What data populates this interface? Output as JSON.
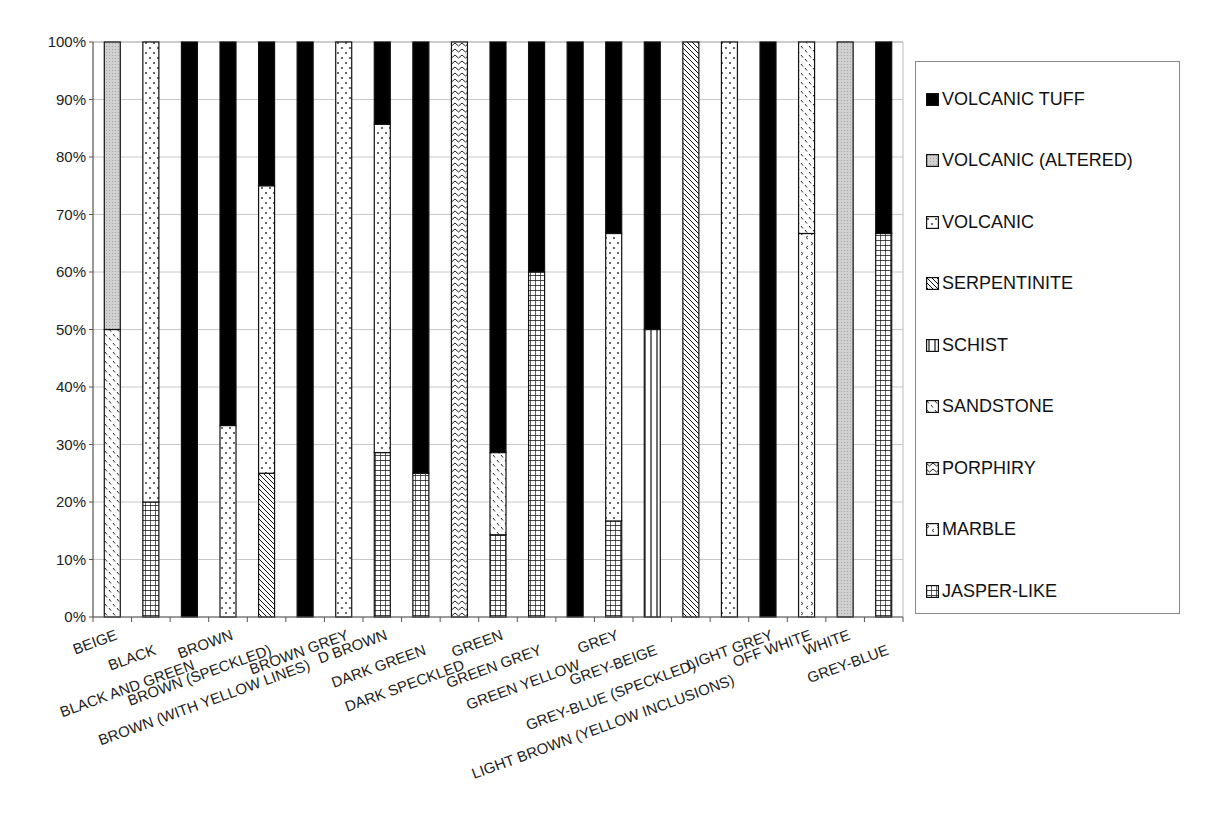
{
  "chart_data": {
    "type": "bar",
    "stacked": "percent",
    "title": "",
    "xlabel": "",
    "ylabel": "",
    "ylim": [
      0,
      100
    ],
    "yticks": [
      "0%",
      "10%",
      "20%",
      "30%",
      "40%",
      "50%",
      "60%",
      "70%",
      "80%",
      "90%",
      "100%"
    ],
    "grid": true,
    "legend_position": "right",
    "categories": [
      "BEIGE",
      "BLACK",
      "BLACK AND GREEN",
      "BROWN",
      "BROWN (SPECKLED)",
      "BROWN (WITH YELLOW LINES)",
      "BROWN GREY",
      "D BROWN",
      "DARK GREEN",
      "DARK SPECKLED",
      "GREEN",
      "GREEN GREY",
      "GREEN YELLOW",
      "GREY",
      "GREY-BEIGE",
      "GREY-BLUE (SPECKLED)",
      "LIGHT BROWN (YELLOW INCLUSIONS)",
      "LIGHT GREY",
      "OFF WHITE",
      "WHITE",
      "GREY-BLUE"
    ],
    "series": [
      {
        "name": "JASPER-LIKE",
        "pattern": "grid",
        "values": [
          0,
          20,
          0,
          0,
          0,
          0,
          0,
          28.6,
          25,
          0,
          14.3,
          60,
          0,
          16.7,
          0,
          0,
          0,
          0,
          0,
          0,
          66.7
        ]
      },
      {
        "name": "MARBLE",
        "pattern": "chevron-dots",
        "values": [
          0,
          0,
          0,
          0,
          0,
          0,
          0,
          0,
          0,
          0,
          0,
          0,
          0,
          0,
          0,
          0,
          0,
          0,
          66.7,
          0,
          0
        ]
      },
      {
        "name": "PORPHIRY",
        "pattern": "wave",
        "values": [
          0,
          0,
          0,
          0,
          0,
          0,
          0,
          0,
          0,
          100,
          0,
          0,
          0,
          0,
          0,
          0,
          0,
          0,
          0,
          0,
          0
        ]
      },
      {
        "name": "SANDSTONE",
        "pattern": "dashes",
        "values": [
          50,
          0,
          0,
          0,
          0,
          0,
          0,
          0,
          0,
          0,
          14.3,
          0,
          0,
          0,
          0,
          0,
          0,
          0,
          33.3,
          0,
          0
        ]
      },
      {
        "name": "SCHIST",
        "pattern": "vertical-lines",
        "values": [
          0,
          0,
          0,
          0,
          0,
          0,
          0,
          0,
          0,
          0,
          0,
          0,
          0,
          0,
          50,
          0,
          0,
          0,
          0,
          0,
          0
        ]
      },
      {
        "name": "SERPENTINITE",
        "pattern": "diagonal",
        "values": [
          0,
          0,
          0,
          0,
          25,
          0,
          0,
          0,
          0,
          0,
          0,
          0,
          0,
          0,
          0,
          100,
          0,
          0,
          0,
          0,
          0
        ]
      },
      {
        "name": "VOLCANIC",
        "pattern": "dots",
        "values": [
          0,
          80,
          0,
          33.3,
          50,
          0,
          100,
          57.1,
          0,
          0,
          0,
          0,
          0,
          50,
          0,
          0,
          100,
          0,
          0,
          0,
          0
        ]
      },
      {
        "name": "VOLCANIC (ALTERED)",
        "pattern": "grey",
        "values": [
          50,
          0,
          0,
          0,
          0,
          0,
          0,
          0,
          0,
          0,
          0,
          0,
          0,
          0,
          0,
          0,
          0,
          0,
          0,
          100,
          0
        ]
      },
      {
        "name": "VOLCANIC TUFF",
        "pattern": "solid-black",
        "values": [
          0,
          0,
          100,
          66.7,
          25,
          100,
          0,
          14.3,
          75,
          0,
          71.4,
          40,
          100,
          33.3,
          50,
          0,
          0,
          100,
          0,
          0,
          33.3
        ]
      }
    ]
  },
  "legend": {
    "items": [
      {
        "label": "VOLCANIC TUFF",
        "pattern": "solid-black"
      },
      {
        "label": "VOLCANIC (ALTERED)",
        "pattern": "grey"
      },
      {
        "label": "VOLCANIC",
        "pattern": "dots"
      },
      {
        "label": "SERPENTINITE",
        "pattern": "diagonal"
      },
      {
        "label": "SCHIST",
        "pattern": "vertical-lines"
      },
      {
        "label": "SANDSTONE",
        "pattern": "dashes"
      },
      {
        "label": "PORPHIRY",
        "pattern": "wave"
      },
      {
        "label": "MARBLE",
        "pattern": "chevron-dots"
      },
      {
        "label": "JASPER-LIKE",
        "pattern": "grid"
      }
    ]
  },
  "colors": {
    "grid": "#c8c8c8",
    "axis": "#555555",
    "tuff": "#000000",
    "altered": "#c9c9c9"
  }
}
